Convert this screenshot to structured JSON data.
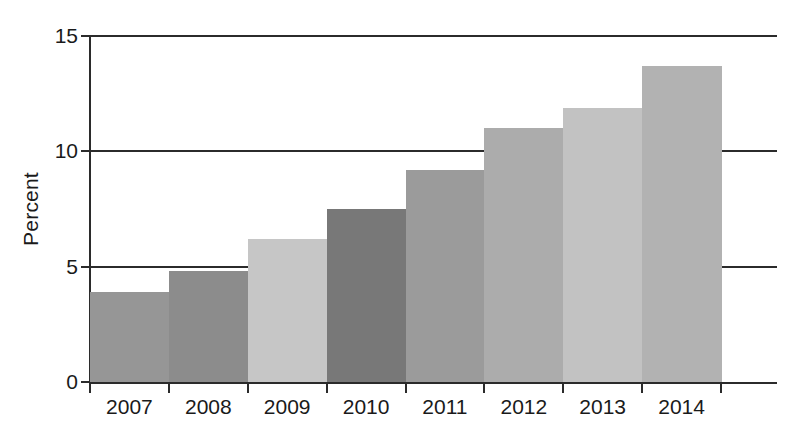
{
  "chart_data": {
    "type": "bar",
    "title": "",
    "subtitle": "",
    "xlabel": "",
    "ylabel": "Percent",
    "categories": [
      "2007",
      "2008",
      "2009",
      "2010",
      "2011",
      "2012",
      "2013",
      "2014"
    ],
    "values": [
      3.9,
      4.8,
      6.2,
      7.5,
      9.2,
      11.0,
      11.9,
      13.7
    ],
    "ylim": [
      0,
      15
    ],
    "yticks": [
      0,
      5,
      10,
      15
    ],
    "ytick_labels": [
      "0",
      "5",
      "10",
      "15"
    ],
    "grid": "horizontal",
    "legend": "none",
    "bar_colors": [
      "#969696",
      "#8c8c8c",
      "#c6c6c6",
      "#787878",
      "#9b9b9b",
      "#acacac",
      "#c2c2c2",
      "#b2b2b2"
    ],
    "axis_color": "#2b2b2b",
    "background": "#ffffff",
    "annotations": []
  }
}
